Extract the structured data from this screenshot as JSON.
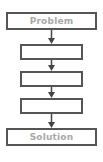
{
  "diagram": {
    "type": "flowchart",
    "direction": "top-to-bottom",
    "nodes": [
      {
        "id": "problem",
        "label": "Problem"
      },
      {
        "id": "step1",
        "label": ""
      },
      {
        "id": "step2",
        "label": ""
      },
      {
        "id": "step3",
        "label": ""
      },
      {
        "id": "solution",
        "label": "Solution"
      }
    ],
    "edges": [
      {
        "from": "problem",
        "to": "step1"
      },
      {
        "from": "step1",
        "to": "step2"
      },
      {
        "from": "step2",
        "to": "step3"
      },
      {
        "from": "step3",
        "to": "solution"
      }
    ]
  },
  "colors": {
    "border": "#555555",
    "label": "#a8a8a8",
    "arrow": "#444444"
  }
}
